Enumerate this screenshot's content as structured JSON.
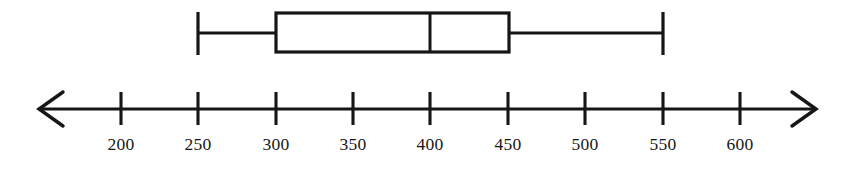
{
  "figure": {
    "kind": "box-and-whisker-plot-on-number-line",
    "background_color": "#ffffff",
    "line_color": "#161616",
    "width": 850,
    "height": 173
  },
  "axis": {
    "name": "number-line",
    "line_y": 109,
    "left_arrow_tip_x": 40,
    "right_arrow_tip_x": 815,
    "tick_top_y": 92,
    "tick_bottom_y": 125,
    "label_baseline_y": 152,
    "ticks": [
      {
        "label": "200",
        "value": 200,
        "x": 121
      },
      {
        "label": "250",
        "value": 250,
        "x": 198
      },
      {
        "label": "300",
        "value": 300,
        "x": 276
      },
      {
        "label": "350",
        "value": 350,
        "x": 353
      },
      {
        "label": "400",
        "value": 400,
        "x": 430
      },
      {
        "label": "450",
        "value": 450,
        "x": 508
      },
      {
        "label": "500",
        "value": 500,
        "x": 585
      },
      {
        "label": "550",
        "value": 550,
        "x": 663
      },
      {
        "label": "600",
        "value": 600,
        "x": 740
      }
    ]
  },
  "chart_data": {
    "type": "box",
    "title": "",
    "xlabel": "",
    "ylabel": "",
    "grid": false,
    "legend": null,
    "orientation": "horizontal",
    "xlim": [
      170,
      640
    ],
    "xticks": [
      200,
      250,
      300,
      350,
      400,
      450,
      500,
      550,
      600
    ],
    "xticklabels": [
      "200",
      "250",
      "300",
      "350",
      "400",
      "450",
      "500",
      "550",
      "600"
    ],
    "series": [
      {
        "name": "box-1",
        "minimum": 250,
        "q1": 300,
        "median": 400,
        "q3": 450,
        "maximum": 550,
        "iqr": 150,
        "range": 300,
        "outliers": []
      }
    ]
  },
  "box_geometry": {
    "name": "box-whisker-glyph",
    "whisker_center_y": 33,
    "box_top_y": 13,
    "box_bottom_y": 52,
    "cap_top_y": 12,
    "cap_bottom_y": 55,
    "min_x": 198,
    "q1_x": 276,
    "median_x": 430,
    "q3_x": 509,
    "max_x": 662
  }
}
